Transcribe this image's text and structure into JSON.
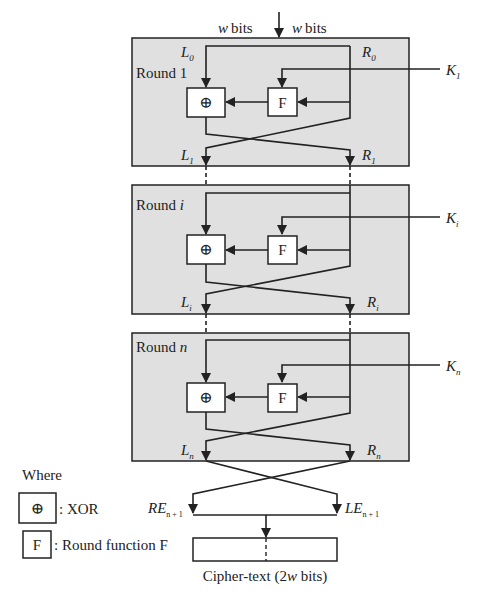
{
  "diagram": {
    "input": {
      "left_label": "w bits",
      "right_label": "w bits"
    },
    "rounds": [
      {
        "label": "Round 1",
        "label_prefix": "Round",
        "label_var": "1",
        "var_italic": false,
        "in_left": "L",
        "in_left_sub": "0",
        "in_right": "R",
        "in_right_sub": "0",
        "key": "K",
        "key_sub": "1",
        "out_left": "L",
        "out_left_sub": "1",
        "out_right": "R",
        "out_right_sub": "1",
        "xor_symbol": "⊕",
        "f_label": "F"
      },
      {
        "label": "Round i",
        "label_prefix": "Round",
        "label_var": "i",
        "var_italic": true,
        "key": "K",
        "key_sub": "i",
        "out_left": "L",
        "out_left_sub": "i",
        "out_right": "R",
        "out_right_sub": "i",
        "xor_symbol": "⊕",
        "f_label": "F"
      },
      {
        "label": "Round n",
        "label_prefix": "Round",
        "label_var": "n",
        "var_italic": true,
        "key": "K",
        "key_sub": "n",
        "out_left": "L",
        "out_left_sub": "n",
        "out_right": "R",
        "out_right_sub": "n",
        "xor_symbol": "⊕",
        "f_label": "F"
      }
    ],
    "final_swap": {
      "left": "RE",
      "left_sub": "n + 1",
      "right": "LE",
      "right_sub": "n + 1"
    },
    "output": {
      "label_prefix": "Cipher-text (2",
      "label_var": "w",
      "label_suffix": " bits)"
    },
    "legend": {
      "title": "Where",
      "items": [
        {
          "symbol": "⊕",
          "text": ": XOR"
        },
        {
          "symbol": "F",
          "text": ": Round function F"
        }
      ]
    },
    "colors": {
      "round_fill": "#e0e0e0",
      "stroke": "#222222",
      "box_fill": "#ffffff"
    }
  }
}
